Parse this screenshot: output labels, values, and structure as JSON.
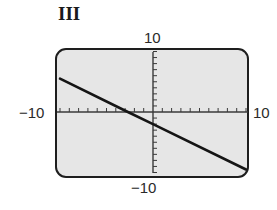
{
  "panel": {
    "label": "III"
  },
  "axes": {
    "xmin_label": "−10",
    "xmax_label": "10",
    "ymin_label": "−10",
    "ymax_label": "10"
  },
  "colors": {
    "screen_bg": "#e6e6e6",
    "frame": "#1e1e1e",
    "axis": "#3a3a3a",
    "line": "#151515"
  },
  "chart_data": {
    "type": "line",
    "title": "III",
    "xlabel": "",
    "ylabel": "",
    "xlim": [
      -10,
      10
    ],
    "ylim": [
      -10,
      10
    ],
    "grid": false,
    "x_ticks_step": 1,
    "y_ticks_step": 1,
    "tick_labels": {
      "x": [
        "-10",
        "10"
      ],
      "y": [
        "-10",
        "10"
      ]
    },
    "series": [
      {
        "name": "line",
        "equation_estimate": "y = -0.75x - 2",
        "x": [
          -10,
          -2.7,
          0,
          10
        ],
        "y": [
          5.5,
          0,
          -2,
          -9.5
        ]
      }
    ],
    "legend": null
  }
}
